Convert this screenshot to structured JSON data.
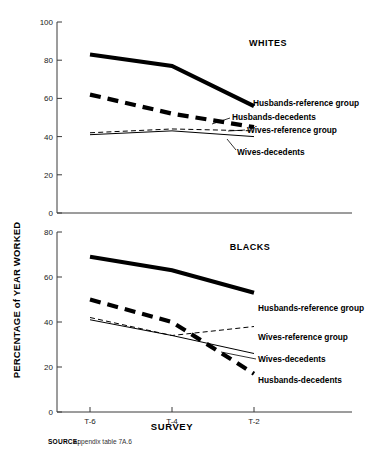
{
  "figure": {
    "ylabel": "PERCENTAGE of YEAR WORKED",
    "xlabel": "SURVEY",
    "source_key": "SOURCE:",
    "source_text": "Appendix table  7A.6"
  },
  "chart_data": {
    "type": "line",
    "title": "",
    "xlabel": "SURVEY",
    "ylabel": "PERCENTAGE of YEAR WORKED",
    "x": [
      "T-6",
      "T-4",
      "T-2"
    ],
    "xticklabels": [
      "T-6",
      "T-4",
      "T-2"
    ],
    "grid": false,
    "legend_position": "inline-right",
    "panels": [
      {
        "name": "WHITES",
        "title": "WHITES",
        "ylim": [
          0,
          100
        ],
        "yticks": [
          0,
          20,
          40,
          60,
          80,
          100
        ],
        "yticklabels": [
          "0",
          "20",
          "40",
          "60",
          "80",
          "100"
        ],
        "series": [
          {
            "name": "Husbands-reference group",
            "label": "Husbands-reference group",
            "style": "thick-solid",
            "values": [
              83,
              77,
              56
            ]
          },
          {
            "name": "Husbands-decedents",
            "label": "Husbands-decedents",
            "style": "thick-dashed",
            "values": [
              62,
              52,
              45
            ]
          },
          {
            "name": "Wives-reference group",
            "label": "Wives-reference group",
            "style": "thin-dashed",
            "values": [
              42,
              44,
              43
            ]
          },
          {
            "name": "Wives-decedents",
            "label": "Wives-decedents",
            "style": "thin-solid",
            "values": [
              41,
              43,
              40
            ]
          }
        ]
      },
      {
        "name": "BLACKS",
        "title": "BLACKS",
        "ylim": [
          0,
          80
        ],
        "yticks": [
          0,
          20,
          40,
          60,
          80
        ],
        "yticklabels": [
          "0",
          "20",
          "40",
          "60",
          "80"
        ],
        "series": [
          {
            "name": "Husbands-reference group",
            "label": "Husbands-reference group",
            "style": "thick-solid",
            "values": [
              69,
              63,
              53
            ]
          },
          {
            "name": "Husbands-decedents",
            "label": "Husbands-decedents",
            "style": "thick-dashed",
            "values": [
              50,
              40,
              17
            ]
          },
          {
            "name": "Wives-reference group",
            "label": "Wives-reference group",
            "style": "thin-dashed",
            "values": [
              42,
              34,
              38
            ]
          },
          {
            "name": "Wives-decedents",
            "label": "Wives-decedents",
            "style": "thin-solid",
            "values": [
              41,
              34,
              26
            ]
          }
        ]
      }
    ]
  }
}
